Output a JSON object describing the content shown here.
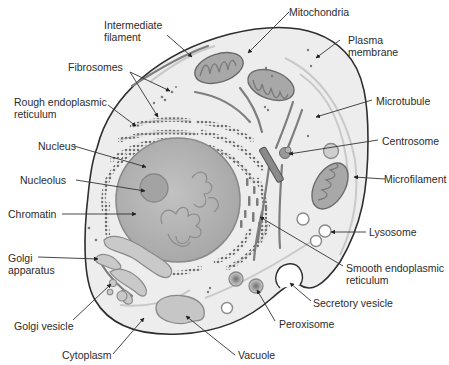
{
  "diagram": {
    "colors": {
      "background": "#ffffff",
      "cytoplasm": "#ededed",
      "membrane": "#2e2e2e",
      "organelle_fill": "#a9a9a9",
      "organelle_stroke": "#6d6d6d",
      "nucleus_fill": "#b8b8b8",
      "nucleolus_fill": "#a4a4a4",
      "er_dots": "#7a7a7a",
      "label_text": "#2b2b2b",
      "leader_line": "#333333"
    },
    "labels": [
      {
        "id": "intermediate-filament",
        "text": "Intermediate\nfilament"
      },
      {
        "id": "mitochondria",
        "text": "Mitochondria"
      },
      {
        "id": "plasma-membrane",
        "text": "Plasma\nmembrane"
      },
      {
        "id": "fibrosomes",
        "text": "Fibrosomes"
      },
      {
        "id": "rough-er",
        "text": "Rough endoplasmic\nreticulum"
      },
      {
        "id": "microtubule",
        "text": "Microtubule"
      },
      {
        "id": "nucleus",
        "text": "Nucleus"
      },
      {
        "id": "centrosome",
        "text": "Centrosome"
      },
      {
        "id": "nucleolus",
        "text": "Nucleolus"
      },
      {
        "id": "microfilament",
        "text": "Microfilament"
      },
      {
        "id": "chromatin",
        "text": "Chromatin"
      },
      {
        "id": "lysosome",
        "text": "Lysosome"
      },
      {
        "id": "golgi-apparatus",
        "text": "Golgi\napparatus"
      },
      {
        "id": "smooth-er",
        "text": "Smooth endoplasmic\nreticulum"
      },
      {
        "id": "secretory-vesicle",
        "text": "Secretory vesicle"
      },
      {
        "id": "peroxisome",
        "text": "Peroxisome"
      },
      {
        "id": "golgi-vesicle",
        "text": "Golgi vesicle"
      },
      {
        "id": "cytoplasm",
        "text": "Cytoplasm"
      },
      {
        "id": "vacuole",
        "text": "Vacuole"
      }
    ]
  }
}
